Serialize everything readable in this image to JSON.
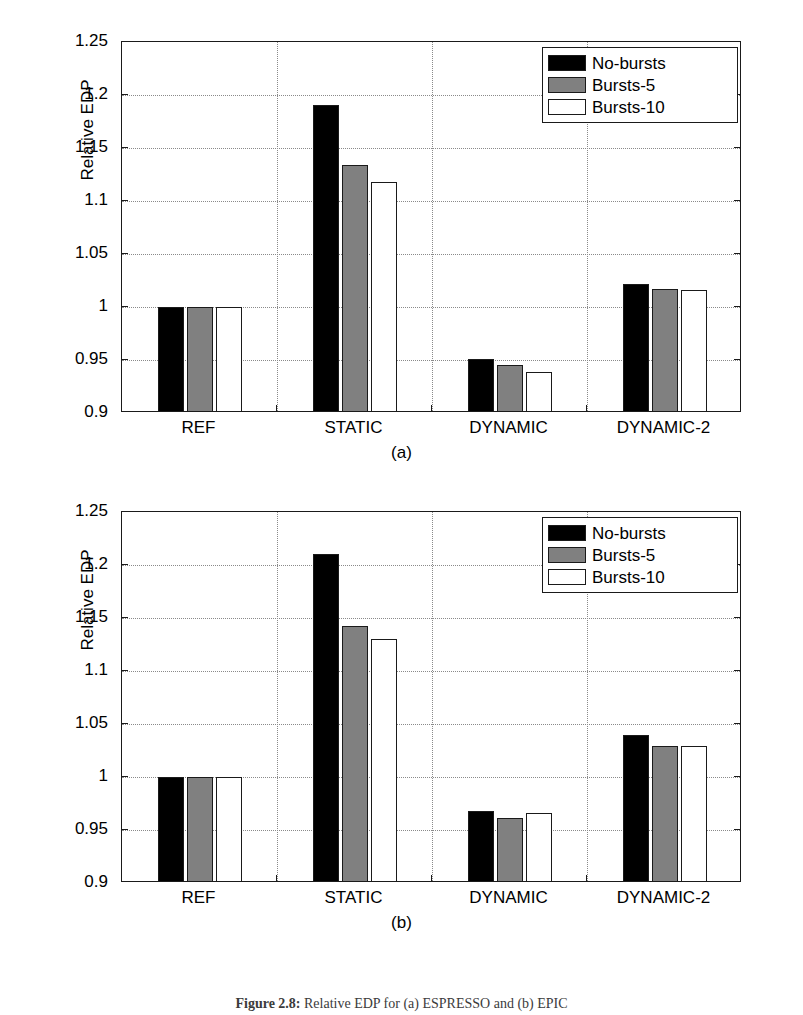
{
  "figure": {
    "caption_label": "Figure 2.8:",
    "caption_text": "Relative EDP for (a) ESPRESSO and (b) EPIC"
  },
  "axis": {
    "ylabel": "Relative EDP",
    "yticks": [
      "1.25",
      "1.2",
      "1.15",
      "1.1",
      "1.05",
      "1",
      "0.95",
      "0.9"
    ],
    "ytick_values": [
      1.25,
      1.2,
      1.15,
      1.1,
      1.05,
      1.0,
      0.95,
      0.9
    ],
    "ymin": 0.9,
    "ymax": 1.25,
    "categories": [
      "REF",
      "STATIC",
      "DYNAMIC",
      "DYNAMIC-2"
    ]
  },
  "legend": {
    "entries": [
      {
        "label": "No-bursts",
        "swatch": "black",
        "color": "#000000"
      },
      {
        "label": "Bursts-5",
        "swatch": "gray",
        "color": "#808080"
      },
      {
        "label": "Bursts-10",
        "swatch": "white",
        "color": "#ffffff"
      }
    ]
  },
  "panels": [
    {
      "id": "a",
      "tag": "(a)"
    },
    {
      "id": "b",
      "tag": "(b)"
    }
  ],
  "chart_data": [
    {
      "type": "bar",
      "panel": "(a)",
      "title": "",
      "xlabel": "",
      "ylabel": "Relative EDP",
      "ylim": [
        0.9,
        1.25
      ],
      "grid": true,
      "legend_position": "top-right",
      "categories": [
        "REF",
        "STATIC",
        "DYNAMIC",
        "DYNAMIC-2"
      ],
      "series": [
        {
          "name": "No-bursts",
          "color": "#000000",
          "values": [
            1.0,
            1.191,
            0.951,
            1.022
          ]
        },
        {
          "name": "Bursts-5",
          "color": "#808080",
          "values": [
            1.0,
            1.134,
            0.945,
            1.017
          ]
        },
        {
          "name": "Bursts-10",
          "color": "#ffffff",
          "values": [
            1.0,
            1.118,
            0.939,
            1.016
          ]
        }
      ]
    },
    {
      "type": "bar",
      "panel": "(b)",
      "title": "",
      "xlabel": "",
      "ylabel": "Relative EDP",
      "ylim": [
        0.9,
        1.25
      ],
      "grid": true,
      "legend_position": "top-right",
      "categories": [
        "REF",
        "STATIC",
        "DYNAMIC",
        "DYNAMIC-2"
      ],
      "series": [
        {
          "name": "No-bursts",
          "color": "#000000",
          "values": [
            1.0,
            1.21,
            0.968,
            1.04
          ]
        },
        {
          "name": "Bursts-5",
          "color": "#808080",
          "values": [
            1.0,
            1.142,
            0.961,
            1.029
          ]
        },
        {
          "name": "Bursts-10",
          "color": "#ffffff",
          "values": [
            1.0,
            1.13,
            0.966,
            1.029
          ]
        }
      ]
    }
  ]
}
